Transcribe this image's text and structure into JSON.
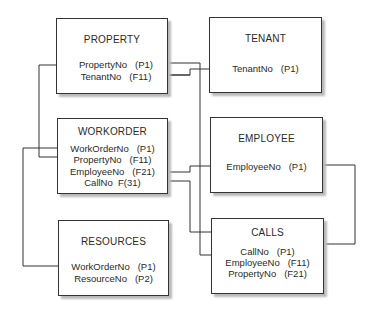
{
  "diagram": {
    "type": "relational-schema",
    "tables": [
      {
        "id": "property",
        "name": "PROPERTY",
        "fields": [
          {
            "name": "PropertyNo",
            "key": "(P1)"
          },
          {
            "name": "TenantNo",
            "key": "(F11)"
          }
        ]
      },
      {
        "id": "tenant",
        "name": "TENANT",
        "fields": [
          {
            "name": "TenantNo",
            "key": "(P1)"
          }
        ]
      },
      {
        "id": "workorder",
        "name": "WORKORDER",
        "fields": [
          {
            "name": "WorkOrderNo",
            "key": "(P1)"
          },
          {
            "name": "PropertyNo",
            "key": "(F11)"
          },
          {
            "name": "EmployeeNo",
            "key": "(F21)"
          },
          {
            "name": "CallNo",
            "key": "F(31)"
          }
        ]
      },
      {
        "id": "employee",
        "name": "EMPLOYEE",
        "fields": [
          {
            "name": "EmployeeNo",
            "key": "(P1)"
          }
        ]
      },
      {
        "id": "resources",
        "name": "RESOURCES",
        "fields": [
          {
            "name": "WorkOrderNo",
            "key": "(P1)"
          },
          {
            "name": "ResourceNo",
            "key": "(P2)"
          }
        ]
      },
      {
        "id": "calls",
        "name": "CALLS",
        "fields": [
          {
            "name": "CallNo",
            "key": "(P1)"
          },
          {
            "name": "EmployeeNo",
            "key": "(F11)"
          },
          {
            "name": "PropertyNo",
            "key": "(F21)"
          }
        ]
      }
    ],
    "relationships": [
      {
        "from": "TENANT.TenantNo",
        "to": "PROPERTY.TenantNo"
      },
      {
        "from": "PROPERTY.PropertyNo",
        "to": "WORKORDER.PropertyNo"
      },
      {
        "from": "PROPERTY.PropertyNo",
        "to": "CALLS.PropertyNo"
      },
      {
        "from": "WORKORDER.WorkOrderNo",
        "to": "RESOURCES.WorkOrderNo"
      },
      {
        "from": "EMPLOYEE.EmployeeNo",
        "to": "WORKORDER.EmployeeNo"
      },
      {
        "from": "EMPLOYEE.EmployeeNo",
        "to": "CALLS.EmployeeNo"
      },
      {
        "from": "CALLS.CallNo",
        "to": "WORKORDER.CallNo"
      }
    ],
    "colors": {
      "line": "#333333",
      "shadow": "#b9b9b9",
      "text": "#2a2a2a"
    }
  }
}
